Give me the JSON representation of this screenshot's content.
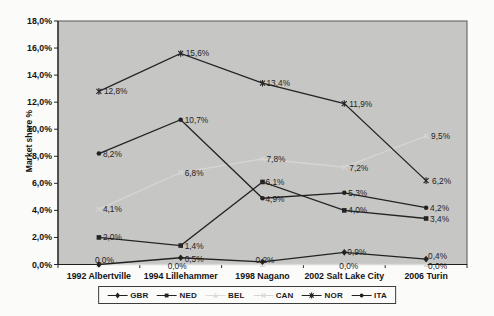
{
  "figure": {
    "kind": "scanned line chart, no title",
    "background": "#fbfbfa",
    "plot_background": "#c6c6c5",
    "axis_color": "#2a2a2a",
    "label_color": "#1d1d1d"
  },
  "chart_data": {
    "type": "line",
    "title": "",
    "xlabel": "",
    "ylabel": "Market share %",
    "ylim": [
      0,
      18
    ],
    "grid": false,
    "legend_position": "bottom",
    "y_tick_values": [
      0,
      2,
      4,
      6,
      8,
      10,
      12,
      14,
      16,
      18
    ],
    "y_tick_labels": [
      "0,0%",
      "2,0%",
      "4,0%",
      "6,0%",
      "8,0%",
      "10,0%",
      "12,0%",
      "14,0%",
      "16,0%",
      "18,0%"
    ],
    "categories": [
      "1992 Albertville",
      "1994 Lillehammer",
      "1998 Nagano",
      "2002 Salt Lake City",
      "2006 Turin"
    ],
    "series": [
      {
        "name": "GBR",
        "marker": "diamond",
        "color": "#222222",
        "values": [
          0.0,
          0.5,
          0.2,
          0.9,
          0.4
        ],
        "labels": [
          "0,0%",
          "0,5%",
          "0,2%",
          "0,9%",
          "0,4%"
        ]
      },
      {
        "name": "NED",
        "marker": "square",
        "color": "#242424",
        "values": [
          2.0,
          1.4,
          6.1,
          4.0,
          3.4
        ],
        "labels": [
          "2,0%",
          "1,4%",
          "6,1%",
          "4,0%",
          "3,4%"
        ]
      },
      {
        "name": "BEL",
        "marker": "triangle",
        "color": "#dbdbd8",
        "values": [
          0.0,
          0.0,
          0.0,
          0.0,
          0.0
        ],
        "labels": [
          "",
          "0,0%",
          "",
          "0,0%",
          "0,0%"
        ]
      },
      {
        "name": "CAN",
        "marker": "x",
        "color": "#d6d6d3",
        "values": [
          4.1,
          6.8,
          7.8,
          7.2,
          9.5
        ],
        "labels": [
          "4,1%",
          "6,8%",
          "7,8%",
          "7,2%",
          "9,5%"
        ]
      },
      {
        "name": "NOR",
        "marker": "star",
        "color": "#242424",
        "values": [
          12.8,
          15.6,
          13.4,
          11.9,
          6.2
        ],
        "labels": [
          "12,8%",
          "15,6%",
          "13,4%",
          "11,9%",
          "6,2%"
        ]
      },
      {
        "name": "ITA",
        "marker": "circle",
        "color": "#222222",
        "values": [
          8.2,
          10.7,
          4.9,
          5.3,
          4.2
        ],
        "labels": [
          "8,2%",
          "10,7%",
          "4,9%",
          "5,3%",
          "4,2%"
        ]
      }
    ],
    "draw_order": [
      "BEL",
      "CAN",
      "NED",
      "NOR",
      "ITA",
      "GBR"
    ],
    "label_offsets": {
      "GBR": [
        [
          -4,
          -2
        ],
        [
          4,
          4
        ],
        [
          -7,
          1
        ],
        [
          3,
          3
        ],
        [
          2,
          0
        ]
      ],
      "BEL": [
        null,
        [
          -13,
          4
        ],
        null,
        [
          -5,
          4
        ],
        [
          2,
          4
        ]
      ],
      "NED": [
        [
          4,
          3
        ],
        [
          4,
          3
        ],
        [
          3,
          3
        ],
        [
          4,
          3
        ],
        [
          4,
          3
        ]
      ],
      "CAN": [
        [
          4,
          3
        ],
        [
          4,
          3
        ],
        [
          4,
          3
        ],
        [
          5,
          4
        ],
        [
          5,
          3
        ]
      ],
      "NOR": [
        [
          5,
          3
        ],
        [
          5,
          3
        ],
        [
          4,
          3
        ],
        [
          5,
          3
        ],
        [
          6,
          3
        ]
      ],
      "ITA": [
        [
          4,
          3
        ],
        [
          4,
          3
        ],
        [
          3,
          4
        ],
        [
          4,
          3
        ],
        [
          4,
          3
        ]
      ]
    }
  }
}
